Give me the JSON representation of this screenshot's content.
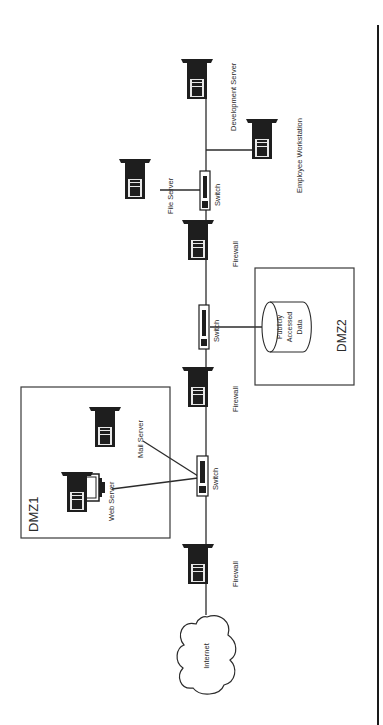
{
  "diagram": {
    "orientation": "rotated-90-ccw",
    "colors": {
      "line": "#2b2b2b",
      "background": "#ffffff",
      "device": "#1e1e1e",
      "border": "#3a3a3a"
    },
    "nodes": {
      "internet": {
        "label": "Internet"
      },
      "firewall1": {
        "label": "Firewall"
      },
      "switch1": {
        "label": "Switch"
      },
      "firewall2": {
        "label": "Firewall"
      },
      "switch2": {
        "label": "Switch"
      },
      "firewall3": {
        "label": "Firewall"
      },
      "switch3": {
        "label": "Switch"
      },
      "web_server": {
        "label": "Web Server"
      },
      "mail_server": {
        "label": "Mail Server"
      },
      "public_data": {
        "label_lines": [
          "Publicly",
          "Accessed",
          "Data"
        ]
      },
      "file_server": {
        "label": "File Server"
      },
      "dev_server": {
        "label": "Development Server"
      },
      "employee_ws": {
        "label": "Employee Workstation"
      }
    },
    "zones": {
      "dmz1": {
        "label": "DMZ1"
      },
      "dmz2": {
        "label": "DMZ2"
      }
    },
    "edges": [
      [
        "internet",
        "firewall1"
      ],
      [
        "firewall1",
        "switch1"
      ],
      [
        "switch1",
        "web_server"
      ],
      [
        "switch1",
        "mail_server"
      ],
      [
        "switch1",
        "firewall2"
      ],
      [
        "firewall2",
        "switch2"
      ],
      [
        "switch2",
        "public_data"
      ],
      [
        "switch2",
        "firewall3"
      ],
      [
        "firewall3",
        "switch3"
      ],
      [
        "switch3",
        "file_server"
      ],
      [
        "switch3",
        "dev_server"
      ],
      [
        "switch3",
        "employee_ws"
      ]
    ]
  }
}
